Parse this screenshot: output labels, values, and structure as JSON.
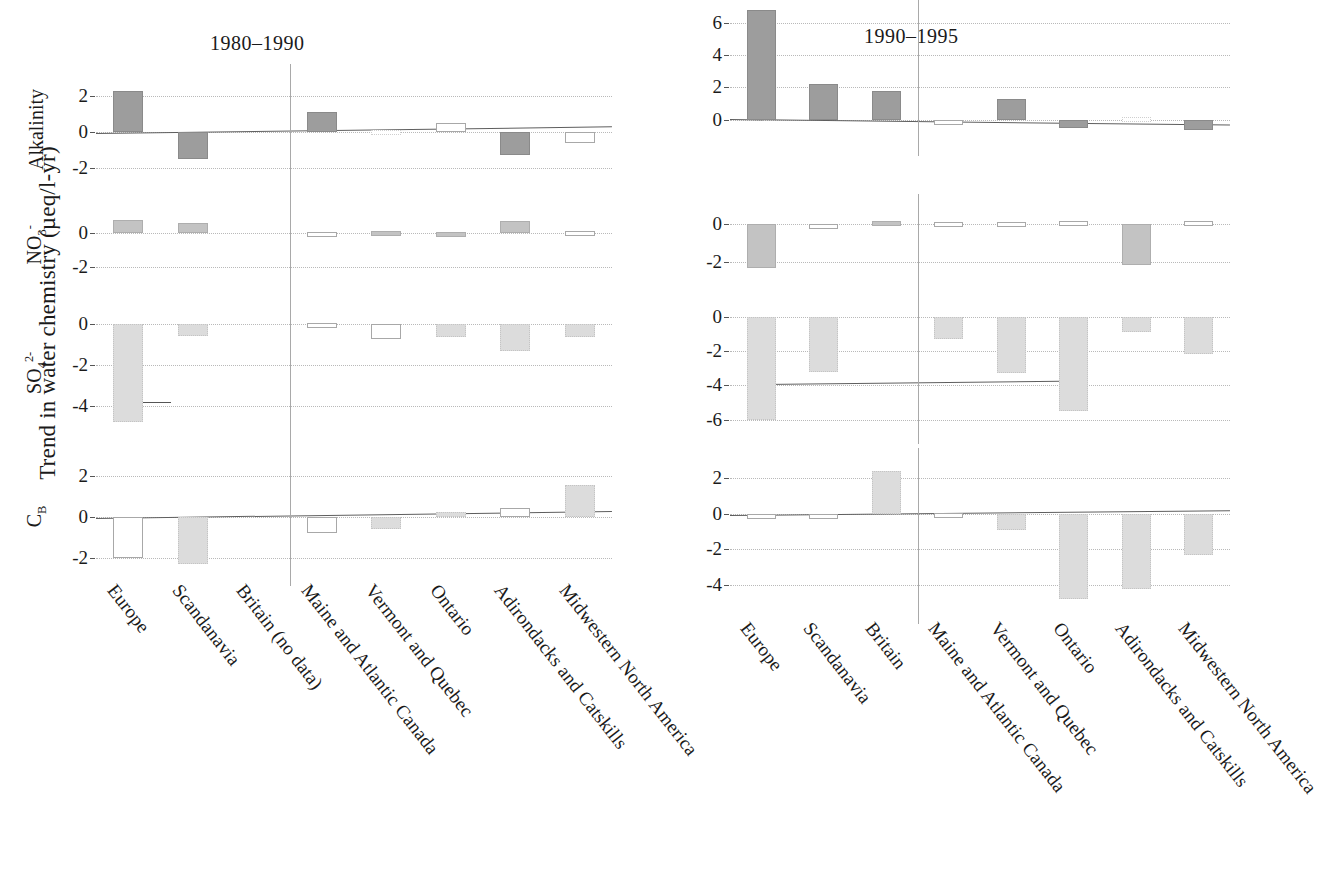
{
  "figure": {
    "y_axis_title": "Trend in water chemistry (µeq/l-yr)",
    "panel_titles": [
      "1980–1990",
      "1990–1995"
    ],
    "row_labels": [
      "Alkalinity",
      "NO3-",
      "SO42-",
      "CB"
    ]
  },
  "chart_data": {
    "type": "bar",
    "ylabel": "Trend in water chemistry (µeq/l-yr)",
    "xlabel": "",
    "grid": true,
    "legend": "none",
    "panels": [
      {
        "title": "1980–1990",
        "categories": [
          "Europe",
          "Scandanavia",
          "Britain (no data)",
          "Maine and Atlantic Canada",
          "Vermont and Quebec",
          "Ontario",
          "Adirondacks and Catskills",
          "Midwestern North America"
        ],
        "rows": [
          {
            "label": "Alkalinity",
            "ylim": [
              -3.0,
              3.0
            ],
            "ticks": [
              2,
              0,
              -2
            ],
            "values": [
              2.3,
              -1.5,
              null,
              1.1,
              0.1,
              0.5,
              -1.3,
              -0.6
            ],
            "fills": [
              "filled-dark",
              "filled-dark",
              null,
              "filled-dark",
              "open-faint",
              "open",
              "filled-dark",
              "open"
            ],
            "trendline": [
              -0.05,
              0.32
            ]
          },
          {
            "label": "NO3-",
            "ylim": [
              -3.0,
              1.6
            ],
            "ticks": [
              0,
              -2
            ],
            "values": [
              0.75,
              0.6,
              null,
              0.08,
              0.1,
              0.07,
              0.7,
              0.15
            ],
            "fills": [
              "filled-mid",
              "filled-mid",
              null,
              "open",
              "filled-mid",
              "filled-mid",
              "filled-mid",
              "open"
            ],
            "trendline": null
          },
          {
            "label": "SO42-",
            "ylim": [
              -5.4,
              0.6
            ],
            "ticks": [
              0,
              -2,
              -4
            ],
            "values": [
              -4.8,
              -0.6,
              null,
              0.08,
              -0.75,
              -0.65,
              -1.3,
              -0.65
            ],
            "fills": [
              "filled-light",
              "filled-light",
              null,
              "open",
              "open",
              "filled-light",
              "filled-light",
              "filled-light"
            ],
            "trendline": null,
            "stub_at": -3.85
          },
          {
            "label": "CB",
            "ylim": [
              -2.7,
              2.7
            ],
            "ticks": [
              2,
              0,
              -2
            ],
            "values": [
              -2.0,
              -2.3,
              null,
              -0.8,
              -0.6,
              0.25,
              0.45,
              1.55
            ],
            "fills": [
              "open",
              "filled-light",
              null,
              "open",
              "filled-light",
              "filled-light",
              "open",
              "filled-light"
            ],
            "trendline": [
              -0.04,
              0.3
            ]
          }
        ]
      },
      {
        "title": "1990–1995",
        "categories": [
          "Europe",
          "Scandanavia",
          "Britain",
          "Maine and Atlantic Canada",
          "Vermont and Quebec",
          "Ontario",
          "Adirondacks and Catskills",
          "Midwestern North America"
        ],
        "rows": [
          {
            "label": "Alkalinity",
            "ylim": [
              -1.4,
              7.2
            ],
            "ticks": [
              6,
              4,
              2,
              0
            ],
            "values": [
              6.8,
              2.2,
              1.8,
              -0.35,
              1.3,
              -0.5,
              0.15,
              -0.65
            ],
            "fills": [
              "filled-dark",
              "filled-dark",
              "filled-dark",
              "open",
              "filled-dark",
              "filled-dark",
              "open-faint",
              "filled-dark"
            ],
            "trendline": [
              0.05,
              -0.3
            ]
          },
          {
            "label": "NO3-",
            "ylim": [
              -2.9,
              0.8
            ],
            "ticks": [
              0,
              -2
            ],
            "values": [
              -2.3,
              -0.12,
              0.12,
              0.1,
              0.1,
              0.12,
              -2.15,
              0.15
            ],
            "fills": [
              "filled-mid",
              "open",
              "filled-mid",
              "open",
              "open",
              "open",
              "filled-mid",
              "open"
            ],
            "trendline": null
          },
          {
            "label": "SO42-",
            "ylim": [
              -6.6,
              0.5
            ],
            "ticks": [
              0,
              -2,
              -4,
              -6
            ],
            "values": [
              -6.0,
              -3.2,
              null,
              -1.3,
              -3.3,
              -5.5,
              -0.9,
              -2.2
            ],
            "fills": [
              "filled-light",
              "filled-light",
              null,
              "filled-light",
              "filled-light",
              "filled-light",
              "filled-light",
              "filled-light"
            ],
            "trendline": [
              -3.9,
              -3.7
            ]
          },
          {
            "label": "CB",
            "ylim": [
              -5.4,
              2.9
            ],
            "ticks": [
              2,
              0,
              -2,
              -4
            ],
            "values": [
              -0.25,
              -0.05,
              2.4,
              0.05,
              -0.9,
              -4.8,
              -4.2,
              -2.3
            ],
            "fills": [
              "open",
              "open",
              "filled-light",
              "open",
              "filled-light",
              "filled-light",
              "filled-light",
              "filled-light"
            ],
            "trendline": [
              -0.05,
              0.22
            ]
          }
        ]
      }
    ]
  }
}
